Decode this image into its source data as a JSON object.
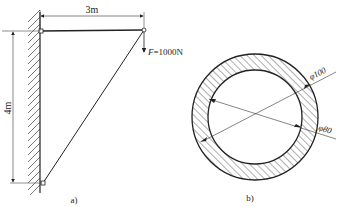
{
  "figure_a": {
    "caption": "a)",
    "horizontal_dimension": "3m",
    "vertical_dimension": "4m",
    "force_symbol": "F",
    "force_value": "=1000N"
  },
  "figure_b": {
    "caption": "b)",
    "outer_diameter": "φ100",
    "inner_diameter": "φ80"
  },
  "colors": {
    "line": "#222222",
    "background": "#ffffff"
  }
}
